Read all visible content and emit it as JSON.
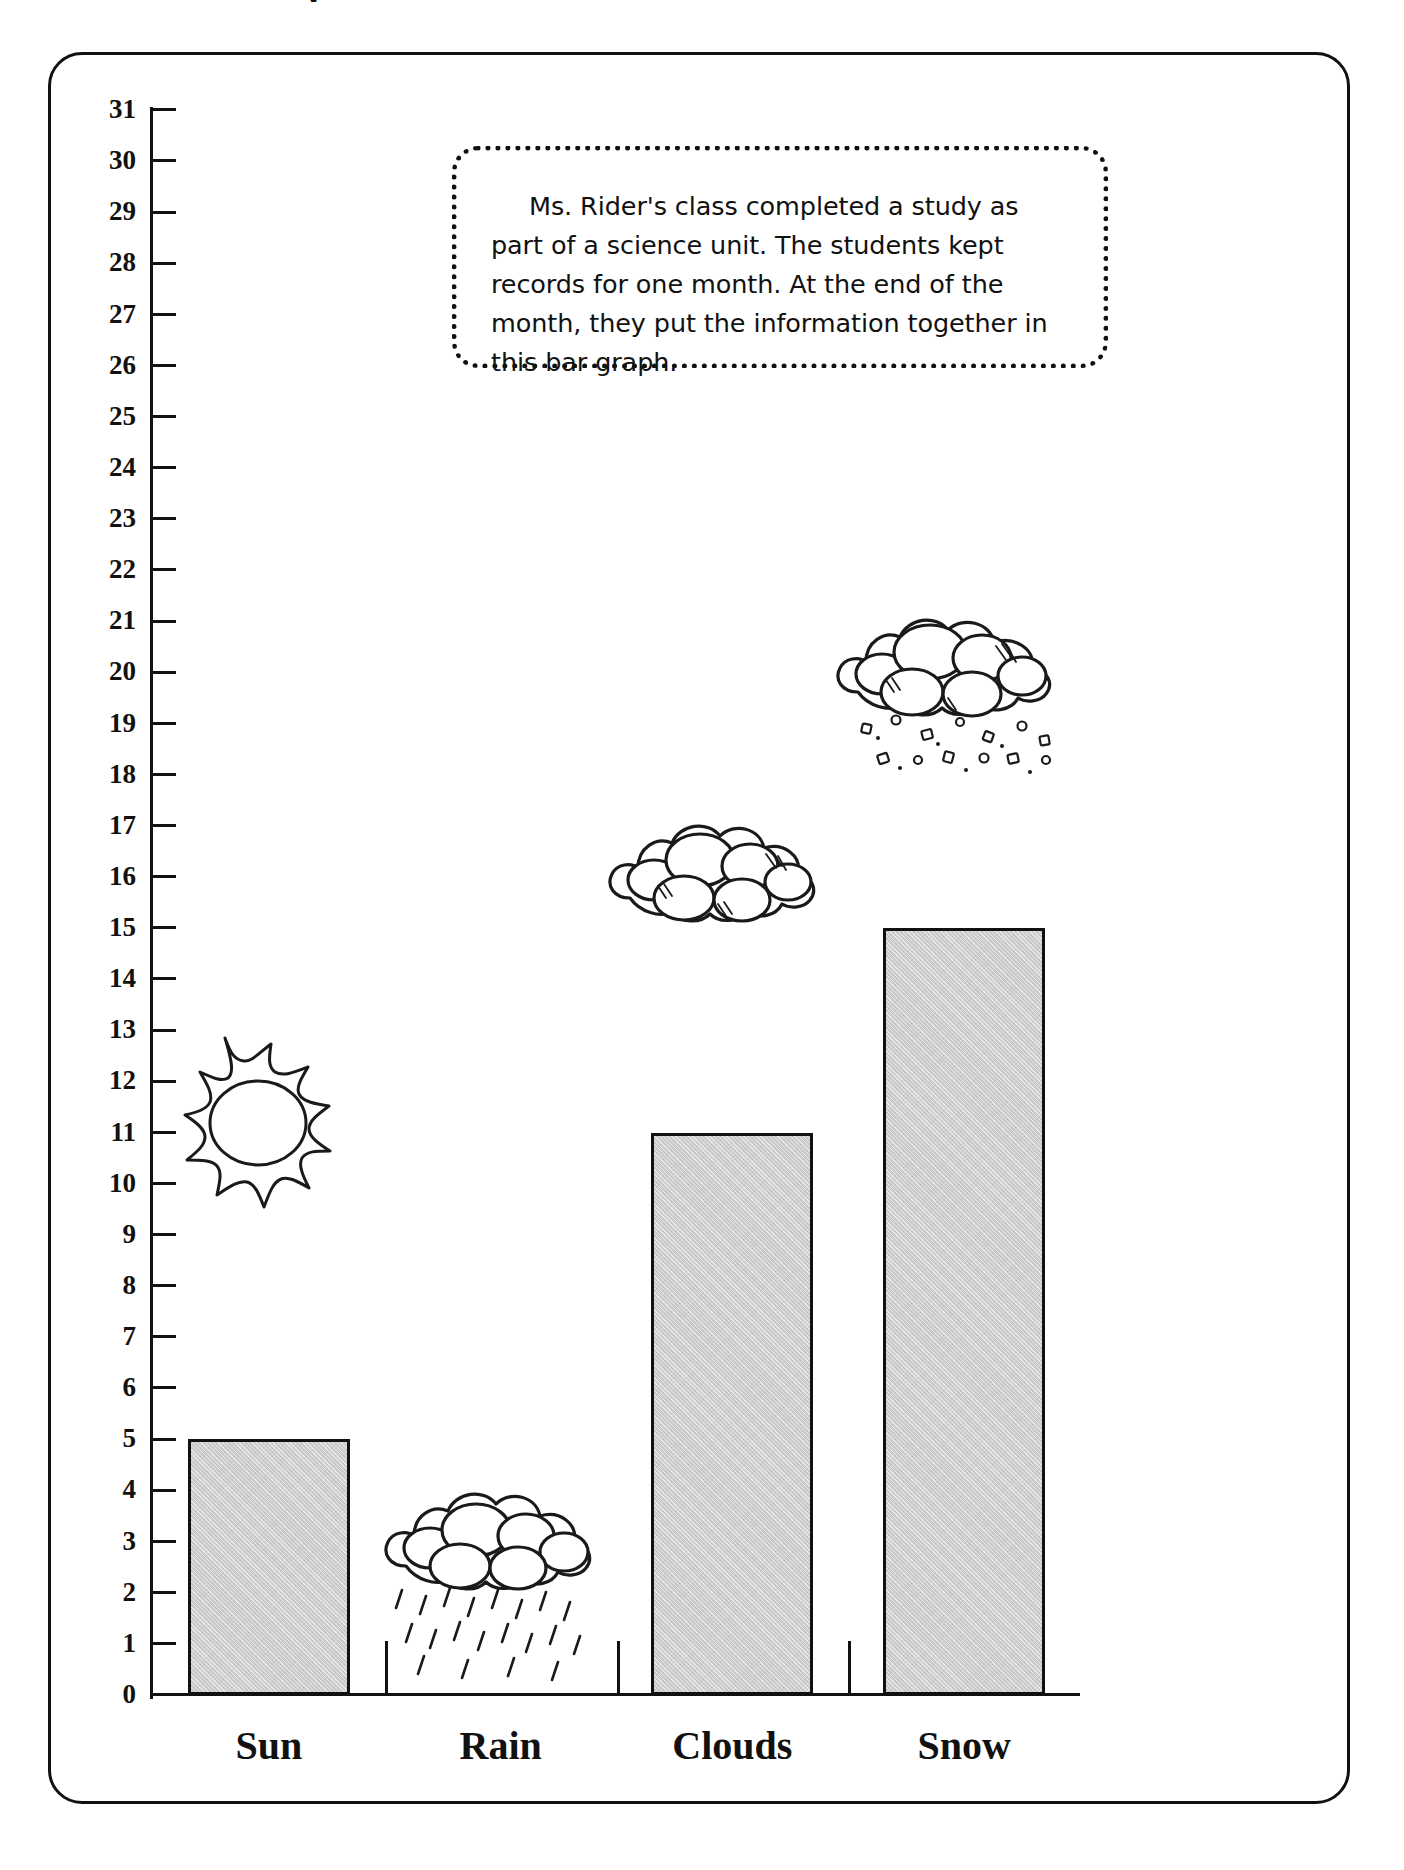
{
  "page": {
    "title_fragment": "y",
    "background": "#ffffff",
    "frame_color": "#111111"
  },
  "info_bubble": {
    "name": "instruction-bubble",
    "text": "Ms. Rider's class completed a study as part of a science unit. The students kept records for one month. At the end of the month, they put the information together in this bar graph.",
    "border_style": "dotted",
    "border_color": "#111111"
  },
  "chart_data": {
    "type": "bar",
    "title": "",
    "subtitle": "",
    "xlabel": "",
    "ylabel": "",
    "categories": [
      "Sun",
      "Rain",
      "Clouds",
      "Snow"
    ],
    "values": [
      5,
      0,
      11,
      15
    ],
    "series": [
      {
        "name": "Days",
        "values": [
          5,
          0,
          11,
          15
        ]
      }
    ],
    "ylim": [
      0,
      31
    ],
    "ytick_step": 1,
    "ytick_labels": [
      "0",
      "1",
      "2",
      "3",
      "4",
      "5",
      "6",
      "7",
      "8",
      "9",
      "10",
      "11",
      "12",
      "13",
      "14",
      "15",
      "16",
      "17",
      "18",
      "19",
      "20",
      "21",
      "22",
      "23",
      "24",
      "25",
      "26",
      "27",
      "28",
      "29",
      "30",
      "31"
    ],
    "grid": false,
    "legend": "none",
    "bar_fill_color": "#cdcdcd",
    "bar_border_color": "#111111",
    "axis_color": "#111111",
    "icons": [
      "sun-icon",
      "rain-cloud-icon",
      "cloud-icon",
      "snow-cloud-icon"
    ]
  }
}
